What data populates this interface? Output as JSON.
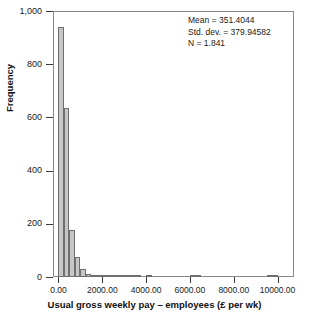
{
  "chart_data": {
    "type": "bar",
    "title": "",
    "subtitle": "",
    "xlabel": "Usual gross weekly pay – employees (£ per wk)",
    "ylabel": "Frequency",
    "xlim": [
      -250,
      10750
    ],
    "ylim": [
      0,
      1000
    ],
    "grid": false,
    "legend": null,
    "bin_width": 250,
    "x_tick_values": [
      0,
      2000,
      4000,
      6000,
      8000,
      10000
    ],
    "x_tick_labels": [
      "0.00",
      "2000.00",
      "4000.00",
      "6000.00",
      "8000.00",
      "10000.00"
    ],
    "y_tick_values": [
      0,
      200,
      400,
      600,
      800,
      1000
    ],
    "y_tick_labels": [
      "0",
      "200",
      "400",
      "600",
      "800",
      "1,000"
    ],
    "bin_centers": [
      125,
      375,
      625,
      875,
      1125,
      1375,
      1625,
      1875,
      2125,
      2375,
      2625,
      2875,
      3125,
      3375,
      3625,
      3875,
      4125,
      4375,
      4625,
      4875,
      5125,
      5375,
      5625,
      5875,
      6125,
      6375,
      6625,
      6875,
      7125,
      7375,
      7625,
      7875,
      8125,
      8375,
      8625,
      8875,
      9125,
      9375,
      9625,
      9875,
      10125
    ],
    "values": [
      940,
      635,
      175,
      75,
      30,
      12,
      8,
      6,
      5,
      4,
      3,
      3,
      2,
      2,
      2,
      0,
      2,
      0,
      0,
      0,
      0,
      0,
      0,
      0,
      3,
      2,
      0,
      0,
      0,
      0,
      0,
      0,
      0,
      0,
      0,
      0,
      0,
      0,
      4,
      3,
      0
    ],
    "annotations": {
      "mean_label": "Mean = 351.4044",
      "std_dev_label": "Std. dev. = 379.94582",
      "n_label": "N = 1.841"
    },
    "colors": {
      "bar_fill": "#c6c6c6",
      "bar_stroke": "#6f6f6f",
      "axis": "#8a8a8a",
      "text": "#1a1a1a",
      "background": "#ffffff"
    }
  }
}
